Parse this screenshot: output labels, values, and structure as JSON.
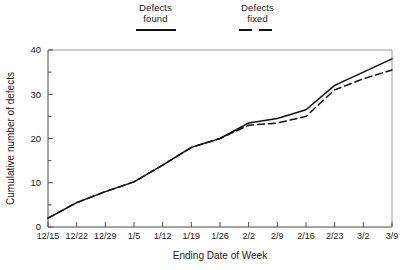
{
  "legend": {
    "entries": [
      {
        "line1": "Defects",
        "line2": "found",
        "style": "solid",
        "icon": "solid-line-swatch-icon"
      },
      {
        "line1": "Defects",
        "line2": "fixed",
        "style": "dashed",
        "icon": "dashed-line-swatch-icon"
      }
    ]
  },
  "chart_data": {
    "type": "line",
    "title": "",
    "xlabel": "Ending Date of Week",
    "ylabel": "Cumulative number of defects",
    "categories": [
      "12/15",
      "12/22",
      "12/29",
      "1/5",
      "1/12",
      "1/19",
      "1/26",
      "2/2",
      "2/9",
      "2/16",
      "2/23",
      "3/2",
      "3/9"
    ],
    "series": [
      {
        "name": "Defects found",
        "style": "solid",
        "values": [
          2,
          5.5,
          8,
          10.2,
          14,
          18,
          20,
          23.5,
          24.5,
          26.5,
          32,
          35,
          38
        ]
      },
      {
        "name": "Defects fixed",
        "style": "dashed",
        "values": [
          2,
          5.5,
          8,
          10.2,
          14,
          18,
          20,
          23,
          23.5,
          25,
          31,
          33.5,
          35.5
        ]
      }
    ],
    "ylim": [
      0,
      40
    ],
    "yticks": [
      0,
      10,
      20,
      30,
      40
    ],
    "yticklabels": [
      "0",
      "10",
      "20",
      "30",
      "40"
    ],
    "yminorticks": [
      5,
      15,
      25,
      35
    ],
    "grid": false,
    "legend_position": "top-center"
  },
  "colors": {
    "line": "#111111",
    "axis": "#4d4d4d",
    "frame": "#9a9a9a",
    "background": "#ffffff"
  }
}
